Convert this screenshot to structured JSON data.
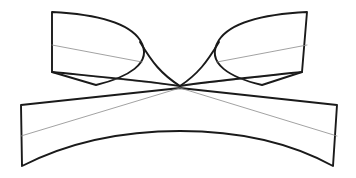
{
  "figure": {
    "canvas": {
      "width": 356,
      "height": 178,
      "background": "#ffffff"
    },
    "stroke_colors": {
      "outline": "#1a1a1a",
      "ruling": "#8a8a8a"
    },
    "stroke_widths": {
      "outline": 1.9,
      "ruling": 0.8
    },
    "waist_point": {
      "x": 180,
      "y": 86
    },
    "shapes": [
      {
        "name": "upper-left-wing",
        "type": "outline-fill",
        "path": "M 52 12 L 52 72 L 96 85 C 125 78 155 64 140 40 C 128 22 92 14 52 12 Z"
      },
      {
        "name": "upper-right-wing",
        "type": "outline-fill",
        "path": "M 307 12 L 302 72 L 262 85 C 232 78 204 64 219 40 C 231 22 267 14 307 12 Z"
      },
      {
        "name": "lower-body",
        "type": "outline-fill",
        "path": "M 21 105 L 180 88 L 337 105 L 333 166 C 280 137 224 131 180 131 C 136 131 79 137 22 166 Z"
      },
      {
        "name": "waist-left-curve",
        "type": "outline",
        "path": "M 140 42 C 152 62 161 74 180 86"
      },
      {
        "name": "waist-right-curve",
        "type": "outline",
        "path": "M 219 42 C 207 62 198 74 180 86"
      },
      {
        "name": "upper-left-wing-lower-sweep",
        "type": "outline",
        "path": "M 52 72 C 92 76 140 80 180 86"
      },
      {
        "name": "upper-right-wing-lower-sweep",
        "type": "outline",
        "path": "M 302 72 C 264 76 218 80 180 86"
      }
    ],
    "rulings": [
      {
        "name": "ruling-upper-left",
        "path": "M 52 45 L 142 62"
      },
      {
        "name": "ruling-upper-right",
        "path": "M 307 45 L 217 62"
      },
      {
        "name": "ruling-lower-left",
        "path": "M 21 136 L 180 88"
      },
      {
        "name": "ruling-lower-right",
        "path": "M 337 136 L 180 88"
      },
      {
        "name": "ruling-cross-left",
        "path": "M 52 72 L 180 86"
      },
      {
        "name": "ruling-cross-right",
        "path": "M 302 72 L 180 86"
      }
    ]
  }
}
